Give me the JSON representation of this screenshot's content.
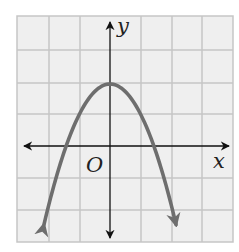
{
  "graph": {
    "title": "",
    "function": "y = 2 - x^2",
    "axis_labels": {
      "x": "x",
      "y": "y",
      "origin": "O"
    },
    "colors": {
      "background": "#ffffff",
      "grid_fill": "#efefef",
      "grid_line": "#c6c6c6",
      "axis": "#111111",
      "curve": "#6e6e6e"
    },
    "grid": {
      "x_min": -3,
      "x_max": 4,
      "y_min": -3,
      "y_max": 4,
      "cell_px": 31
    },
    "origin_px": {
      "x": 110,
      "y": 146
    },
    "vertex": {
      "x": 0,
      "y": 2
    },
    "x_intercepts": [
      -1.414,
      1.414
    ]
  },
  "chart_data": {
    "type": "line",
    "title": "",
    "xlabel": "x",
    "ylabel": "y",
    "origin_label": "O",
    "series": [
      {
        "name": "y = 2 - x^2 (downward parabola)",
        "x": [
          -2.2,
          -2.0,
          -1.5,
          -1.414,
          -1.0,
          -0.5,
          0,
          0.5,
          1.0,
          1.414,
          1.5,
          2.0,
          2.2
        ],
        "values": [
          -2.84,
          -2.0,
          -0.25,
          0,
          1.0,
          1.75,
          2.0,
          1.75,
          1.0,
          0,
          -0.25,
          -2.0,
          -2.84
        ]
      }
    ],
    "xlim": [
      -3,
      4
    ],
    "ylim": [
      -3,
      4
    ],
    "grid": true,
    "tick_labels": false,
    "arrows_on_axes": true,
    "arrows_on_curve_ends": true
  }
}
